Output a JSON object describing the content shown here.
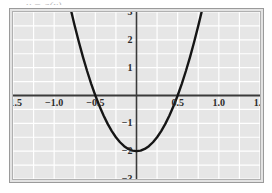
{
  "figure": {
    "top_sliver_text": "y = g(x)",
    "background_color": "#e6e6e6",
    "frame_color": "#9a9a9a",
    "grid_color": "#ffffff",
    "axis_color": "#3a3a3a",
    "curve_color": "#151515"
  },
  "chart_data": {
    "type": "line",
    "title": "",
    "subtitle": "",
    "xlabel": "",
    "ylabel": "",
    "xlim": [
      -1.5,
      1.5
    ],
    "ylim": [
      -3,
      3
    ],
    "grid": true,
    "legend": null,
    "x_ticks": [
      -1.5,
      -1.0,
      -0.5,
      0.5,
      1.0,
      1.5
    ],
    "x_tick_labels": [
      "−1.5",
      "−1.0",
      "−0.5",
      "0.5",
      "1.0",
      "1.5"
    ],
    "y_ticks": [
      3,
      2,
      1,
      -1,
      -2,
      -3
    ],
    "y_tick_labels": [
      "3",
      "2",
      "1",
      "−1",
      "−2",
      "−3"
    ],
    "x_minor_grid_step": 0.25,
    "y_minor_grid_step": 0.5,
    "series": [
      {
        "name": "parabola",
        "equation": "y = 8x^2 - 2",
        "vertex": [
          0,
          -2
        ],
        "roots": [
          -0.5,
          0.5
        ],
        "x_domain": [
          -0.79,
          0.79
        ],
        "color": "#151515",
        "line_width": 2.4,
        "x": [
          -0.79,
          -0.75,
          -0.7,
          -0.65,
          -0.6,
          -0.55,
          -0.5,
          -0.45,
          -0.4,
          -0.35,
          -0.3,
          -0.25,
          -0.2,
          -0.15,
          -0.1,
          -0.05,
          0.0,
          0.05,
          0.1,
          0.15,
          0.2,
          0.25,
          0.3,
          0.35,
          0.4,
          0.45,
          0.5,
          0.55,
          0.6,
          0.65,
          0.7,
          0.75,
          0.79
        ],
        "y": [
          2.99,
          2.5,
          1.92,
          1.38,
          0.88,
          0.42,
          0.0,
          -0.38,
          -0.72,
          -1.02,
          -1.28,
          -1.5,
          -1.68,
          -1.82,
          -1.92,
          -1.98,
          -2.0,
          -1.98,
          -1.92,
          -1.82,
          -1.68,
          -1.5,
          -1.28,
          -1.02,
          -0.72,
          -0.38,
          0.0,
          0.42,
          0.88,
          1.38,
          1.92,
          2.5,
          2.99
        ]
      }
    ]
  }
}
